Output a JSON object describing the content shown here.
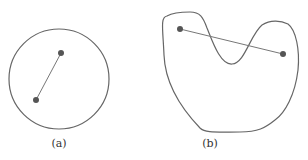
{
  "figures": [
    {
      "id": "a",
      "label": "(a)",
      "shape": "circle",
      "stroke": "#555555",
      "points_color": "#555555"
    },
    {
      "id": "b",
      "label": "(b)",
      "shape": "non-convex blob",
      "stroke": "#555555",
      "points_color": "#555555"
    }
  ]
}
